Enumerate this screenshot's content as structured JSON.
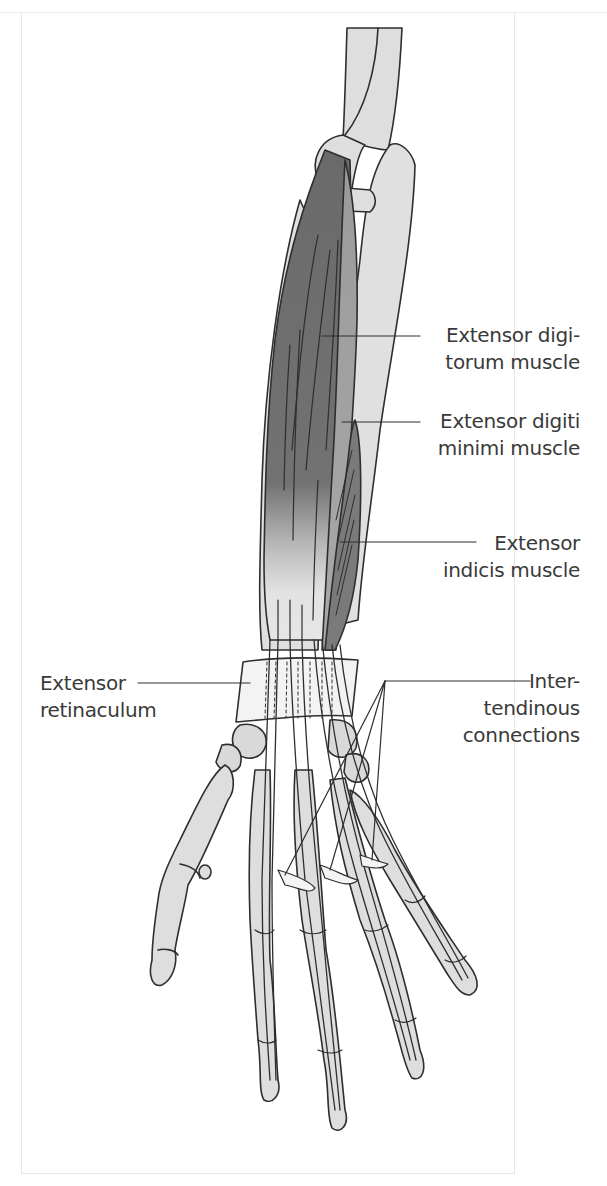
{
  "figure": {
    "colors": {
      "bone_fill": "#dedede",
      "outline": "#2e2e2e",
      "muscle_dark": "#6e6e6e",
      "muscle_mid": "#9a9a9a",
      "retinaculum_fill": "#f2f2f2",
      "label_text": "#3a3a3a",
      "background": "#ffffff"
    }
  },
  "labels": [
    {
      "id": "extensor-digitorum",
      "line1": "Extensor digi-",
      "line2": "torum muscle",
      "side": "right"
    },
    {
      "id": "extensor-digiti-minimi",
      "line1": "Extensor digiti",
      "line2": "minimi muscle",
      "side": "right"
    },
    {
      "id": "extensor-indicis",
      "line1": "Extensor",
      "line2": "indicis muscle",
      "side": "right"
    },
    {
      "id": "extensor-retinaculum",
      "line1": "Extensor",
      "line2": "retinaculum",
      "side": "left"
    },
    {
      "id": "intertendinous-connections",
      "line1": "Inter-",
      "line2": "tendinous",
      "line3": "connections",
      "side": "right"
    }
  ]
}
